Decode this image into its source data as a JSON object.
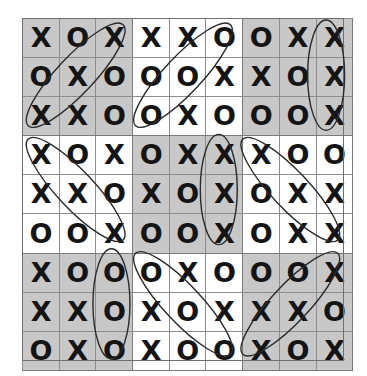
{
  "puzzle": {
    "title": "Tic-Tac-Toe Sudoku Grid",
    "rows": 9,
    "columns": 9,
    "symbols": [
      "X",
      "O"
    ],
    "colors": {
      "grid_line": "#8d8d8d",
      "block_line": "#7a7a7a",
      "shaded_block": "#c8c8c8",
      "light_block": "#ffffff",
      "glyph": "#141414",
      "annotation": "#2a2a2a"
    },
    "grid": [
      [
        "X",
        "O",
        "X",
        "X",
        "X",
        "O",
        "O",
        "X",
        "X"
      ],
      [
        "O",
        "X",
        "O",
        "O",
        "O",
        "X",
        "X",
        "O",
        "X"
      ],
      [
        "X",
        "X",
        "O",
        "O",
        "X",
        "O",
        "O",
        "O",
        "X"
      ],
      [
        "X",
        "O",
        "X",
        "O",
        "X",
        "X",
        "X",
        "O",
        "O"
      ],
      [
        "X",
        "X",
        "O",
        "X",
        "O",
        "X",
        "O",
        "X",
        "X"
      ],
      [
        "O",
        "O",
        "X",
        "O",
        "O",
        "X",
        "O",
        "X",
        "X"
      ],
      [
        "X",
        "O",
        "O",
        "O",
        "X",
        "O",
        "O",
        "O",
        "X"
      ],
      [
        "X",
        "X",
        "O",
        "X",
        "O",
        "X",
        "X",
        "X",
        "O"
      ],
      [
        "O",
        "X",
        "O",
        "X",
        "O",
        "O",
        "X",
        "O",
        "X"
      ]
    ],
    "block_shading": [
      [
        "dark",
        "light",
        "dark"
      ],
      [
        "light",
        "dark",
        "light"
      ],
      [
        "dark",
        "light",
        "dark"
      ]
    ],
    "annotations": [
      {
        "name": "diagonal-run-top-left",
        "type": "oval",
        "orientation": "diagonal-down-right",
        "start_cell": [
          2,
          0
        ],
        "end_cell": [
          0,
          2
        ],
        "sequence": [
          "X",
          "X",
          "X"
        ]
      },
      {
        "name": "diagonal-run-upper-middle",
        "type": "oval",
        "orientation": "diagonal-down-left",
        "start_cell": [
          0,
          5
        ],
        "end_cell": [
          2,
          3
        ],
        "sequence": [
          "O",
          "O",
          "O"
        ]
      },
      {
        "name": "vertical-run-top-right",
        "type": "oval",
        "orientation": "vertical",
        "start_cell": [
          0,
          8
        ],
        "end_cell": [
          2,
          8
        ],
        "sequence": [
          "X",
          "X",
          "X"
        ]
      },
      {
        "name": "diagonal-run-left-middle",
        "type": "oval",
        "orientation": "diagonal-down-right",
        "start_cell": [
          3,
          0
        ],
        "end_cell": [
          5,
          2
        ],
        "sequence": [
          "X",
          "X",
          "X"
        ]
      },
      {
        "name": "vertical-run-center",
        "type": "oval",
        "orientation": "vertical",
        "start_cell": [
          3,
          5
        ],
        "end_cell": [
          5,
          5
        ],
        "sequence": [
          "X",
          "X",
          "X"
        ]
      },
      {
        "name": "diagonal-run-right-middle",
        "type": "oval",
        "orientation": "diagonal-down-right",
        "start_cell": [
          3,
          6
        ],
        "end_cell": [
          5,
          8
        ],
        "sequence": [
          "X",
          "X",
          "X"
        ]
      },
      {
        "name": "vertical-run-bottom-left",
        "type": "oval",
        "orientation": "vertical",
        "start_cell": [
          6,
          2
        ],
        "end_cell": [
          8,
          2
        ],
        "sequence": [
          "O",
          "O",
          "O"
        ]
      },
      {
        "name": "diagonal-run-bottom-middle",
        "type": "oval",
        "orientation": "diagonal-down-right",
        "start_cell": [
          6,
          3
        ],
        "end_cell": [
          8,
          5
        ],
        "sequence": [
          "O",
          "O",
          "O"
        ]
      },
      {
        "name": "diagonal-run-bottom-right",
        "type": "oval",
        "orientation": "diagonal-down-left",
        "start_cell": [
          6,
          8
        ],
        "end_cell": [
          8,
          6
        ],
        "sequence": [
          "X",
          "X",
          "X"
        ]
      }
    ]
  }
}
